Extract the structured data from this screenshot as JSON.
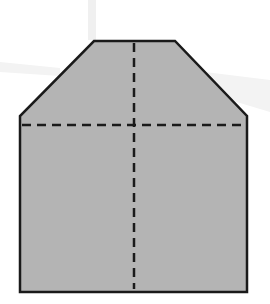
{
  "diagram": {
    "colors": {
      "background": "#ffffff",
      "watermark": "#f0f0f0",
      "fill": "#b4b4b4",
      "outline": "#1a1a1a",
      "fold_line": "#1a1a1a"
    },
    "shape": {
      "type": "polygon",
      "points": [
        [
          94,
          41
        ],
        [
          175,
          41
        ],
        [
          247,
          116
        ],
        [
          247,
          292
        ],
        [
          20,
          292
        ],
        [
          20,
          116
        ]
      ]
    },
    "fold_lines": [
      {
        "name": "vertical-fold",
        "x1": 134,
        "y1": 41,
        "x2": 134,
        "y2": 290,
        "style": "dashed"
      },
      {
        "name": "horizontal-fold",
        "x1": 22,
        "y1": 125,
        "x2": 245,
        "y2": 125,
        "style": "dashed"
      }
    ]
  }
}
